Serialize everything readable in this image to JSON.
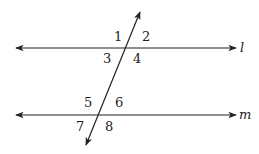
{
  "diagram": {
    "type": "parallel-lines-cut-by-transversal",
    "stroke_color": "#222222",
    "background": "#ffffff",
    "lines": [
      {
        "name": "l",
        "label": "l",
        "x1": 16,
        "y1": 48,
        "x2": 236,
        "y2": 48,
        "label_x": 240,
        "label_y": 52
      },
      {
        "name": "m",
        "label": "m",
        "x1": 16,
        "y1": 115,
        "x2": 236,
        "y2": 115,
        "label_x": 239,
        "label_y": 119
      }
    ],
    "transversal": {
      "x1": 140,
      "y1": 12,
      "x2": 86,
      "y2": 145
    },
    "angles": [
      {
        "label": "1",
        "x": 114,
        "y": 41
      },
      {
        "label": "2",
        "x": 142,
        "y": 41
      },
      {
        "label": "3",
        "x": 103,
        "y": 63
      },
      {
        "label": "4",
        "x": 133,
        "y": 63
      },
      {
        "label": "5",
        "x": 84,
        "y": 107
      },
      {
        "label": "6",
        "x": 115,
        "y": 107
      },
      {
        "label": "7",
        "x": 76,
        "y": 131
      },
      {
        "label": "8",
        "x": 105,
        "y": 131
      }
    ]
  }
}
